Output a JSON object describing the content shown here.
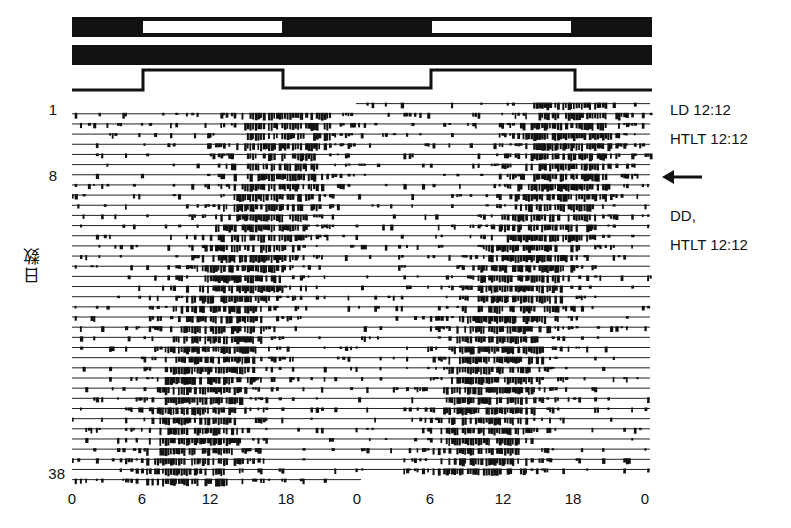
{
  "chart_data": {
    "type": "actogram",
    "title": "",
    "plot": "double-plotted actogram (48 h per row)",
    "xlabel": "",
    "ylabel": "日数",
    "x_ticks": [
      "0",
      "6",
      "12",
      "18",
      "0",
      "6",
      "12",
      "18",
      "0"
    ],
    "y_ticks": [
      "1",
      "8",
      "38"
    ],
    "days": 38,
    "hours_per_row": 48,
    "bars": {
      "light_bar": {
        "light_intervals_h": [
          [
            6,
            18
          ],
          [
            30,
            42
          ]
        ],
        "dark_color": "#111111",
        "light_color": "#ffffff"
      },
      "dd_bar": {
        "all_dark": true
      },
      "temperature_trace": {
        "high_intervals_h": [
          [
            6,
            18
          ],
          [
            30,
            42
          ]
        ],
        "label": "HTLT 12:12"
      }
    },
    "annotations": [
      {
        "text": "LD 12:12",
        "row": 1
      },
      {
        "text": "HTLT 12:12",
        "row": 2
      },
      {
        "text": "arrow",
        "row": 8
      },
      {
        "text": "DD,",
        "row": 12
      },
      {
        "text": "HTLT 12:12",
        "row": 14
      }
    ],
    "activity_center_by_day": {
      "description": "activity band centered near hour 18 at day 1 (LD), drifting earlier to ~hour 10 by day 38 under DD",
      "day_1": 17.5,
      "day_8": 17,
      "day_15": 14.5,
      "day_22": 12,
      "day_30": 10.5,
      "day_38": 9.5
    }
  },
  "labels": {
    "y_axis_title": "日数",
    "day_1": "1",
    "day_8": "8",
    "day_38": "38",
    "cond_ld": "LD 12:12",
    "cond_htlt1": "HTLT 12:12",
    "cond_dd": "DD,",
    "cond_htlt2": "HTLT 12:12",
    "arrow": "←"
  },
  "x_axis": [
    "0",
    "6",
    "12",
    "18",
    "0",
    "6",
    "12",
    "18",
    "0"
  ]
}
